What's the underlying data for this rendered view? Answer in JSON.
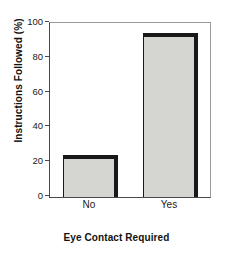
{
  "chart_data": {
    "type": "bar",
    "title": "",
    "subtitle": "",
    "xlabel": "Eye Contact Required",
    "ylabel": "Instructions Followed (%)",
    "categories": [
      "No",
      "Yes"
    ],
    "values": [
      24,
      94
    ],
    "series": [
      {
        "name": "Instructions Followed",
        "values": [
          24,
          94
        ]
      }
    ],
    "ylim": [
      0,
      100
    ],
    "yticks": [
      0,
      20,
      40,
      60,
      80,
      100
    ],
    "ytick_labels": [
      "0",
      "20",
      "40",
      "60",
      "80",
      "100"
    ],
    "grid": false,
    "legend": null,
    "legend_position": "none",
    "annotations": [],
    "colors": {
      "bar_fill": "#d5d5d2",
      "bar_edge": "#181818",
      "axis": "#4a4a4a",
      "frame": "#9a9a9a",
      "text": "#1a1a1a",
      "background": "#ffffff"
    }
  }
}
